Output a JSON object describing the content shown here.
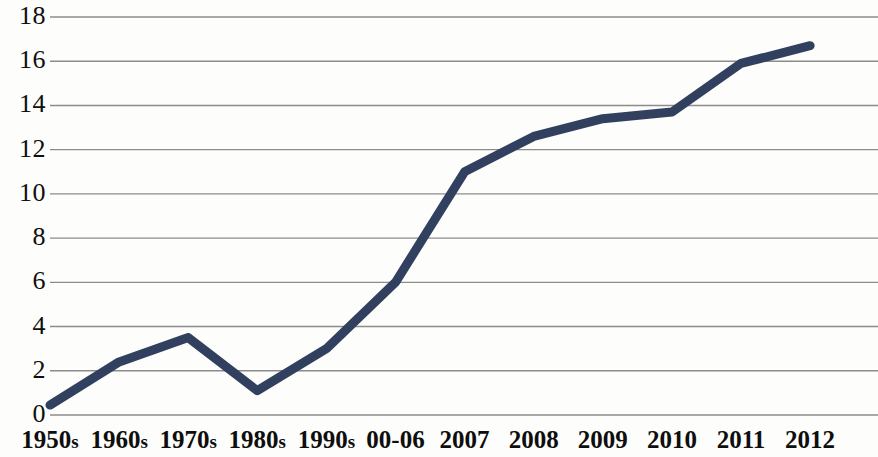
{
  "chart_data": {
    "type": "line",
    "title": "",
    "subtitle": "",
    "xlabel": "",
    "ylabel": "",
    "categories": [
      "1950s",
      "1960s",
      "1970s",
      "1980s",
      "1990s",
      "00-06",
      "2007",
      "2008",
      "2009",
      "2010",
      "2011",
      "2012"
    ],
    "values": [
      0.45,
      2.4,
      3.5,
      1.1,
      3.0,
      6.0,
      11.0,
      12.6,
      13.4,
      13.7,
      15.9,
      16.7
    ],
    "series": [
      {
        "name": "",
        "values": [
          0.45,
          2.4,
          3.5,
          1.1,
          3.0,
          6.0,
          11.0,
          12.6,
          13.4,
          13.7,
          15.9,
          16.7
        ]
      }
    ],
    "ylim": [
      0,
      18
    ],
    "y_ticks": [
      0,
      2,
      4,
      6,
      8,
      10,
      12,
      14,
      16,
      18
    ],
    "y_tick_labels": [
      "0",
      "2",
      "4",
      "6",
      "8",
      "10",
      "12",
      "14",
      "16",
      "18"
    ],
    "grid": true,
    "grid_axis": "y",
    "legend": false,
    "legend_position": "none",
    "line_color": "#31405f",
    "line_width": 9,
    "grid_color": "#8c8c8c",
    "background_color": "#ffffff",
    "markers": false,
    "annotations": []
  },
  "axes": {
    "y_labels": [
      "18",
      "16",
      "14",
      "12",
      "10",
      "8",
      "6",
      "4",
      "2",
      "0"
    ],
    "x_labels": [
      {
        "text": "1950s",
        "base": "1950",
        "suffix": "s"
      },
      {
        "text": "1960s",
        "base": "1960",
        "suffix": "s"
      },
      {
        "text": "1970s",
        "base": "1970",
        "suffix": "s"
      },
      {
        "text": "1980s",
        "base": "1980",
        "suffix": "s"
      },
      {
        "text": "1990s",
        "base": "1990",
        "suffix": "s"
      },
      {
        "text": "00-06",
        "base": "00-06",
        "suffix": ""
      },
      {
        "text": "2007",
        "base": "2007",
        "suffix": ""
      },
      {
        "text": "2008",
        "base": "2008",
        "suffix": ""
      },
      {
        "text": "2009",
        "base": "2009",
        "suffix": ""
      },
      {
        "text": "2010",
        "base": "2010",
        "suffix": ""
      },
      {
        "text": "2011",
        "base": "2011",
        "suffix": ""
      },
      {
        "text": "2012",
        "base": "2012",
        "suffix": ""
      }
    ]
  }
}
